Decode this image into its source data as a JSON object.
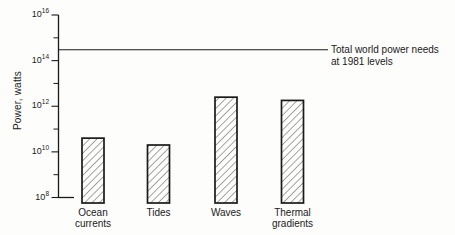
{
  "chart_data": {
    "type": "bar",
    "title": "",
    "xlabel": "",
    "ylabel": "Power, watts",
    "y_scale": "log",
    "ylim": [
      100000000.0,
      1e+16
    ],
    "y_major_tick_exponents": [
      8,
      10,
      12,
      14,
      16
    ],
    "y_major_tick_labels": [
      "10⁸",
      "10¹⁰",
      "10¹²",
      "10¹⁴",
      "10¹⁶"
    ],
    "y_minor_tick_exponents": [
      9,
      11,
      13,
      15
    ],
    "categories": [
      "Ocean currents",
      "Tides",
      "Waves",
      "Thermal gradients"
    ],
    "category_label_lines": [
      [
        "Ocean",
        "currents"
      ],
      [
        "Tides"
      ],
      [
        "Waves"
      ],
      [
        "Thermal",
        "gradients"
      ]
    ],
    "values": [
      40000000000.0,
      20000000000.0,
      2500000000000.0,
      1800000000000.0
    ],
    "unit": "watts",
    "reference_line": {
      "value": 300000000000000.0,
      "label": "Total world power needs at 1981 levels",
      "label_lines": [
        "Total world power needs",
        "at 1981 levels"
      ]
    },
    "grid": false,
    "legend": null,
    "bar_style": "diagonal-hatch"
  },
  "colors": {
    "ink": "#1a1a1a",
    "hatch": "#3a3a3a",
    "background": "#fdfdfc"
  }
}
